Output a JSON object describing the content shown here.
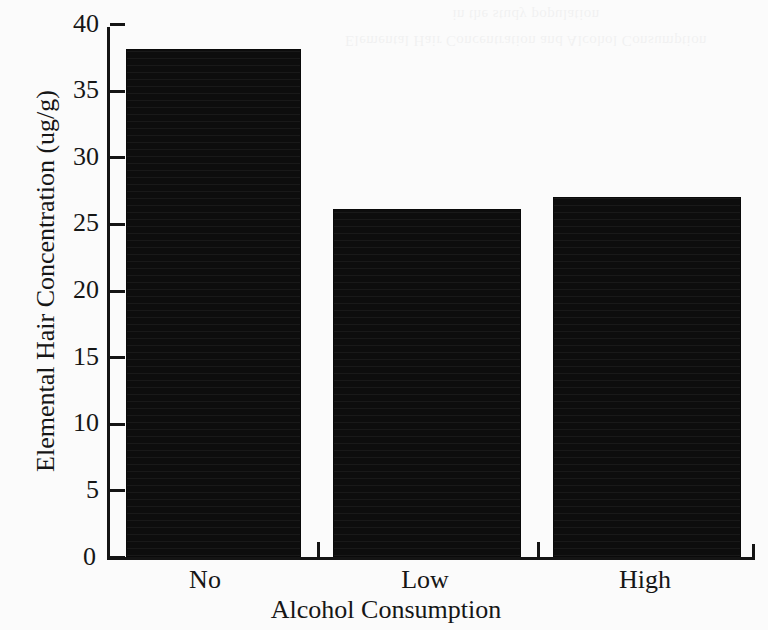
{
  "chart_data": {
    "type": "bar",
    "title": "",
    "xlabel": "Alcohol Consumption",
    "ylabel": "Elemental Hair Concentration (ug/g)",
    "categories": [
      "No",
      "Low",
      "High"
    ],
    "values": [
      38.1,
      26.1,
      27.0
    ],
    "ylim": [
      0,
      40
    ],
    "yticks": [
      0,
      5,
      10,
      15,
      20,
      25,
      30,
      35,
      40
    ],
    "ytick_labels": [
      "0",
      "5",
      "10",
      "15",
      "20",
      "25",
      "30",
      "35",
      "40"
    ],
    "grid": false,
    "legend": null,
    "bar_color": "#0d0d0d",
    "axis_color": "#141414",
    "background_color": "#fbfbfb"
  },
  "artifacts": {
    "scan_bleed_line1": "Elemental Hair Concentration and Alcohol Consumption",
    "scan_bleed_line2": "in the study population"
  }
}
